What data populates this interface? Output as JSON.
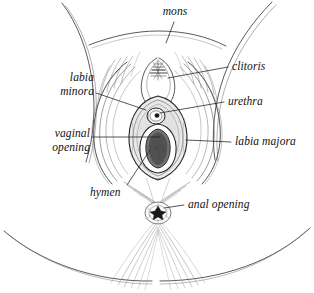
{
  "figure": {
    "type": "anatomical-line-drawing",
    "style": "pen-and-ink hatched illustration, black line art on white",
    "background_color": "#ffffff",
    "ink_color": "#1a1a1a",
    "width": 314,
    "height": 293
  },
  "labels": [
    {
      "id": "mons",
      "text": "mons",
      "align": "center",
      "x": 150,
      "y": 6,
      "leader_from": [
        174,
        22
      ],
      "leader_to": [
        166,
        43
      ]
    },
    {
      "id": "clitoris",
      "text": "clitoris",
      "align": "left",
      "x": 232,
      "y": 60,
      "leader_from": [
        228,
        67
      ],
      "leader_to": [
        168,
        78
      ]
    },
    {
      "id": "urethra",
      "text": "urethra",
      "align": "left",
      "x": 228,
      "y": 95,
      "leader_from": [
        224,
        102
      ],
      "leader_to": [
        160,
        113
      ]
    },
    {
      "id": "labia-majora",
      "text": "labia majora",
      "align": "left",
      "x": 235,
      "y": 135,
      "leader_from": [
        231,
        142
      ],
      "leader_to": [
        186,
        140
      ]
    },
    {
      "id": "labia-minora",
      "text": "labia\nminora",
      "line1": "labia",
      "line2": "minora",
      "align": "right",
      "x": 48,
      "y": 71,
      "width": 46,
      "leader_from": [
        96,
        93
      ],
      "leader_to": [
        146,
        110
      ]
    },
    {
      "id": "vaginal-opening",
      "text": "vaginal\nopening",
      "line1": "vaginal",
      "line2": "opening",
      "align": "right",
      "x": 34,
      "y": 127,
      "width": 56,
      "leader_from": [
        92,
        137
      ],
      "leader_to": [
        160,
        137
      ]
    },
    {
      "id": "hymen",
      "text": "hymen",
      "align": "left",
      "x": 90,
      "y": 186,
      "leader_from": [
        127,
        185
      ],
      "leader_to": [
        150,
        150
      ]
    },
    {
      "id": "anal-opening",
      "text": "anal opening",
      "align": "left",
      "x": 188,
      "y": 198,
      "leader_from": [
        184,
        205
      ],
      "leader_to": [
        162,
        207
      ]
    }
  ],
  "structures": [
    "mons pubis",
    "clitoris and clitoral hood",
    "urethral opening",
    "labia minora",
    "labia majora",
    "vaginal opening (introitus)",
    "hymen",
    "anal opening",
    "perineum",
    "inner thighs"
  ]
}
